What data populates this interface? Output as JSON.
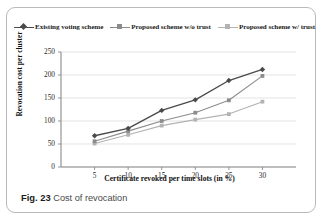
{
  "caption": {
    "figure_label": "Fig. 23",
    "text": "Cost of revocation"
  },
  "chart_data": {
    "type": "line",
    "title": "",
    "xlabel": "Certificate revoked per time slots (in %)",
    "ylabel": "Revocation cost per cluster",
    "categories": [
      "5",
      "10",
      "15",
      "20",
      "25",
      "30"
    ],
    "x": [
      5,
      10,
      15,
      20,
      25,
      30
    ],
    "xlim": [
      0,
      35
    ],
    "ylim": [
      0,
      250
    ],
    "yticks": [
      "0",
      "50",
      "100",
      "150",
      "200",
      "250"
    ],
    "xticks": [
      "5",
      "10",
      "15",
      "20",
      "25",
      "30"
    ],
    "grid": "horizontal",
    "legend_position": "top-center",
    "series": [
      {
        "name": "Existing voting scheme",
        "color": "#4a4a4a",
        "marker": "diamond",
        "values": [
          68,
          84,
          123,
          146,
          188,
          212
        ]
      },
      {
        "name": "Proposed  scheme w/o trust",
        "color": "#8c8c8c",
        "marker": "square",
        "values": [
          56,
          78,
          100,
          118,
          145,
          198
        ]
      },
      {
        "name": "Proposed  scheme w/ trust",
        "color": "#b3b3b3",
        "marker": "square",
        "values": [
          51,
          70,
          90,
          103,
          115,
          142
        ]
      }
    ]
  }
}
